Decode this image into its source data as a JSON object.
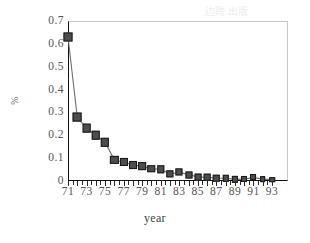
{
  "chart_data": {
    "type": "line",
    "title": "",
    "xlabel": "year",
    "ylabel": "%",
    "xlim": [
      70.5,
      93.5
    ],
    "ylim": [
      0,
      0.7
    ],
    "grid": false,
    "legend": "none",
    "marker": "filled-square",
    "x_tick_labels": [
      "71",
      "73",
      "75",
      "77",
      "79",
      "81",
      "83",
      "85",
      "87",
      "89",
      "91",
      "93"
    ],
    "y_tick_labels": [
      "0",
      "0.1",
      "0.2",
      "0.3",
      "0.4",
      "0.5",
      "0.6",
      "0.7"
    ],
    "y_tick_values": [
      0,
      0.1,
      0.2,
      0.3,
      0.4,
      0.5,
      0.6,
      0.7
    ],
    "x": [
      71,
      72,
      73,
      74,
      75,
      76,
      77,
      78,
      79,
      80,
      81,
      82,
      83,
      84,
      85,
      86,
      87,
      88,
      89,
      90,
      91,
      92,
      93
    ],
    "values": [
      0.63,
      0.28,
      0.23,
      0.2,
      0.17,
      0.092,
      0.082,
      0.071,
      0.064,
      0.053,
      0.052,
      0.03,
      0.038,
      0.028,
      0.018,
      0.016,
      0.013,
      0.012,
      0.007,
      0.008,
      0.016,
      0.008,
      0.006
    ],
    "series": [
      {
        "name": "%",
        "values": [
          0.63,
          0.28,
          0.23,
          0.2,
          0.17,
          0.092,
          0.082,
          0.071,
          0.064,
          0.053,
          0.052,
          0.03,
          0.038,
          0.028,
          0.018,
          0.016,
          0.013,
          0.012,
          0.007,
          0.008,
          0.016,
          0.008,
          0.006
        ]
      }
    ],
    "colors": {
      "marker_fill": "#4d4d4d",
      "marker_edge": "#1a1a1a",
      "line": "#6e6e6e",
      "axis": "#111111",
      "plot_border": "#c9c9c9",
      "tick_text": "#555555",
      "background": "#ffffff"
    }
  },
  "bleed_text": {
    "top_right": "边跨 出版"
  }
}
